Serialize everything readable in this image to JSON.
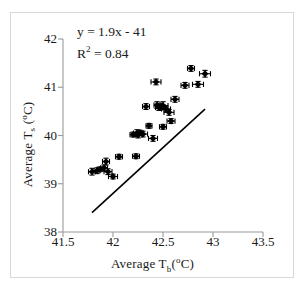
{
  "figure": {
    "background": "#ffffff",
    "frame_color": "#d8d8d8",
    "ink_color": "#000000"
  },
  "annotations": {
    "equation": "y = 1.9x - 41",
    "r_squared_prefix": "R",
    "r_squared_exponent": "2",
    "r_squared_value": "= 0.84"
  },
  "axis_labels": {
    "x_prefix": "Average T",
    "x_subscript": "b",
    "x_units": "(",
    "x_degree": "o",
    "x_units_close": "C)",
    "y_prefix": "Average T",
    "y_subscript": "s",
    "y_units": " (",
    "y_degree": "o",
    "y_units_close": "C)"
  },
  "chart_data": {
    "type": "scatter",
    "title": "",
    "xlabel": "Average Tb (oC)",
    "ylabel": "Average Ts (oC)",
    "xlim": [
      41.5,
      43.5
    ],
    "ylim": [
      38,
      42
    ],
    "xticks": [
      "41.5",
      "42",
      "42.5",
      "43",
      "43.5"
    ],
    "xtick_values": [
      41.5,
      42,
      42.5,
      43,
      43.5
    ],
    "yticks": [
      "38",
      "39",
      "40",
      "41",
      "42"
    ],
    "ytick_values": [
      38,
      39,
      40,
      41,
      42
    ],
    "grid": false,
    "legend": null,
    "marker": "filled-diamond",
    "error_bars": "x-and-y",
    "fit_line": {
      "equation": "y = 1.9x - 41",
      "slope": 1.9,
      "intercept": -41,
      "r_squared": 0.84,
      "x_start": 41.79,
      "x_end": 42.92
    },
    "points": [
      {
        "x": 41.79,
        "y": 39.25,
        "xerr": 0.035,
        "yerr": 0.07
      },
      {
        "x": 41.84,
        "y": 39.27,
        "xerr": 0.03,
        "yerr": 0.06
      },
      {
        "x": 41.87,
        "y": 39.3,
        "xerr": 0.03,
        "yerr": 0.05
      },
      {
        "x": 41.91,
        "y": 39.33,
        "xerr": 0.035,
        "yerr": 0.06
      },
      {
        "x": 41.93,
        "y": 39.46,
        "xerr": 0.035,
        "yerr": 0.07
      },
      {
        "x": 41.95,
        "y": 39.25,
        "xerr": 0.04,
        "yerr": 0.06
      },
      {
        "x": 42.0,
        "y": 39.15,
        "xerr": 0.045,
        "yerr": 0.05
      },
      {
        "x": 42.06,
        "y": 39.56,
        "xerr": 0.035,
        "yerr": 0.05
      },
      {
        "x": 42.2,
        "y": 40.02,
        "xerr": 0.03,
        "yerr": 0.05
      },
      {
        "x": 42.24,
        "y": 40.05,
        "xerr": 0.035,
        "yerr": 0.07
      },
      {
        "x": 42.25,
        "y": 40.01,
        "xerr": 0.04,
        "yerr": 0.06
      },
      {
        "x": 42.27,
        "y": 40.06,
        "xerr": 0.03,
        "yerr": 0.05
      },
      {
        "x": 42.23,
        "y": 39.57,
        "xerr": 0.035,
        "yerr": 0.05
      },
      {
        "x": 42.3,
        "y": 40.03,
        "xerr": 0.045,
        "yerr": 0.06
      },
      {
        "x": 42.33,
        "y": 40.6,
        "xerr": 0.035,
        "yerr": 0.06
      },
      {
        "x": 42.36,
        "y": 40.2,
        "xerr": 0.03,
        "yerr": 0.05
      },
      {
        "x": 42.4,
        "y": 39.94,
        "xerr": 0.045,
        "yerr": 0.06
      },
      {
        "x": 42.43,
        "y": 41.11,
        "xerr": 0.05,
        "yerr": 0.06
      },
      {
        "x": 42.44,
        "y": 40.63,
        "xerr": 0.03,
        "yerr": 0.07
      },
      {
        "x": 42.46,
        "y": 40.58,
        "xerr": 0.035,
        "yerr": 0.06
      },
      {
        "x": 42.48,
        "y": 40.6,
        "xerr": 0.04,
        "yerr": 0.07
      },
      {
        "x": 42.5,
        "y": 40.62,
        "xerr": 0.05,
        "yerr": 0.08
      },
      {
        "x": 42.5,
        "y": 40.18,
        "xerr": 0.035,
        "yerr": 0.05
      },
      {
        "x": 42.53,
        "y": 40.55,
        "xerr": 0.045,
        "yerr": 0.06
      },
      {
        "x": 42.56,
        "y": 40.48,
        "xerr": 0.05,
        "yerr": 0.06
      },
      {
        "x": 42.58,
        "y": 40.3,
        "xerr": 0.04,
        "yerr": 0.05
      },
      {
        "x": 42.62,
        "y": 40.75,
        "xerr": 0.04,
        "yerr": 0.06
      },
      {
        "x": 42.72,
        "y": 41.04,
        "xerr": 0.04,
        "yerr": 0.06
      },
      {
        "x": 42.78,
        "y": 41.39,
        "xerr": 0.035,
        "yerr": 0.06
      },
      {
        "x": 42.85,
        "y": 41.06,
        "xerr": 0.055,
        "yerr": 0.06
      },
      {
        "x": 42.92,
        "y": 41.28,
        "xerr": 0.055,
        "yerr": 0.07
      }
    ]
  }
}
